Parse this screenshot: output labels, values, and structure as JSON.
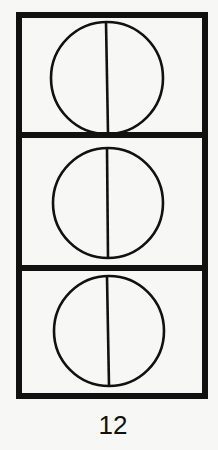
{
  "figure": {
    "label": "12",
    "panels": [
      {
        "id": 1,
        "shape": "circle",
        "divided_by": "vertical-line"
      },
      {
        "id": 2,
        "shape": "circle",
        "divided_by": "vertical-line"
      },
      {
        "id": 3,
        "shape": "circle",
        "divided_by": "vertical-line"
      }
    ],
    "colors": {
      "stroke": "#111111",
      "background": "#f7f7f5"
    }
  }
}
